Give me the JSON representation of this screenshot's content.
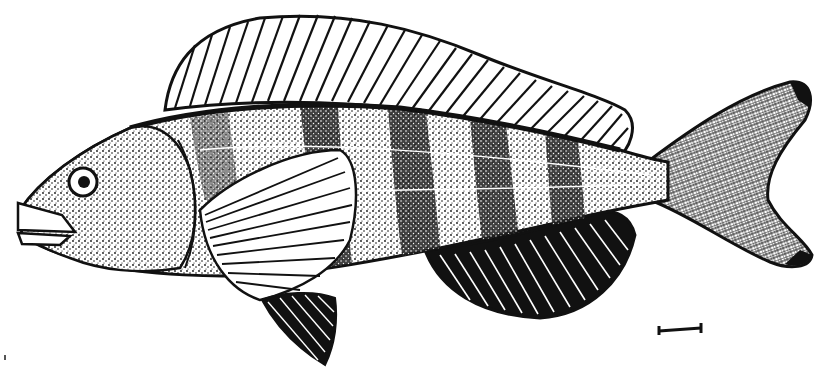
{
  "image": {
    "kind": "scientific-illustration",
    "subject": "fish",
    "style": "black-and-white stippled line drawing",
    "orientation": "facing-left",
    "parts": [
      "head",
      "eye",
      "mouth",
      "dorsal-fin",
      "pectoral-fin",
      "pelvic-fin",
      "anal-fin",
      "caudal-fin",
      "body-bands"
    ],
    "body_band_count": 5
  },
  "scale_bar": {
    "present": true,
    "label": ""
  },
  "colors": {
    "ink": "#111111",
    "paper": "#ffffff"
  }
}
